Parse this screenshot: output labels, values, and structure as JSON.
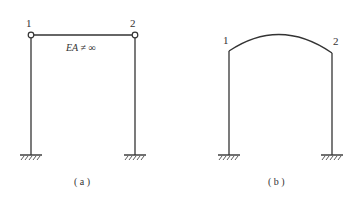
{
  "figure_a": {
    "caption": "( a )",
    "node_labels": [
      "1",
      "2"
    ],
    "beam_label": "EA ≠ ∞",
    "hinge_nodes": true,
    "supports": [
      "fixed",
      "fixed"
    ]
  },
  "figure_b": {
    "caption": "( b )",
    "node_labels": [
      "1",
      "2"
    ],
    "top_member": "curved arch",
    "supports": [
      "fixed",
      "fixed"
    ]
  },
  "colors": {
    "line": "#333333",
    "background": "#ffffff"
  }
}
